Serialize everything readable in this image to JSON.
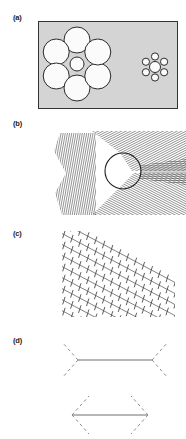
{
  "figure": {
    "background_color": "#ffffff",
    "width": 186,
    "height": 439,
    "panels": [
      {
        "id": "a",
        "label": "(a)",
        "illusion_name": "Ebbinghaus (Titchener circles) illusion",
        "description": "Two central circles of different size each surrounded by a ring of six inducer circles, on a gray rectangular field.",
        "label_x": 13,
        "label_y": 20,
        "field": {
          "x": 38,
          "y": 21,
          "width": 139,
          "height": 87,
          "fill": "#d4d4d4",
          "stroke": "#333333",
          "stroke_width": 1
        },
        "circle_fill": "#fbfbfb",
        "circle_stroke": "#2b2b2b",
        "circle_stroke_width": 1,
        "clusters": [
          {
            "name": "left-cluster",
            "center_x": 77,
            "center_y": 64,
            "center_radius": 7,
            "inducer_radius": 13,
            "inducer_ring_radius": 24,
            "inducer_count": 6,
            "inducer_start_angle": 90
          },
          {
            "name": "right-cluster",
            "center_x": 155,
            "center_y": 67,
            "center_radius": 5.5,
            "inducer_radius": 3.6,
            "inducer_ring_radius": 10.5,
            "inducer_count": 6,
            "inducer_start_angle": 90
          }
        ]
      },
      {
        "id": "b",
        "label": "(b)",
        "illusion_name": "Ehrenstein / Orbison circle distortion illusion",
        "description": "A circle superimposed on converging sets of fine oblique line gratings, making the circle appear deformed into a rounded triangle.",
        "label_x": 13,
        "label_y": 126,
        "line_color": "#3c3c3c",
        "line_width": 0.55,
        "line_spacing": 2.1,
        "circle": {
          "center_x": 123,
          "center_y": 171,
          "radius": 18,
          "stroke": "#1e1e1e",
          "stroke_width": 1.1
        },
        "grating_sectors": [
          {
            "name": "left-vertical-grating",
            "angle_deg": 80
          },
          {
            "name": "upper-right-grating",
            "angle_deg": 27
          },
          {
            "name": "lower-right-grating",
            "angle_deg": -27
          }
        ]
      },
      {
        "id": "c",
        "label": "(c)",
        "illusion_name": "Zollner illusion",
        "description": "Parallel oblique lines crossed by short transverse hatch marks, causing the long lines to appear non-parallel.",
        "label_x": 13,
        "label_y": 236,
        "line_color": "#4a4a4a",
        "main_line_angle_deg": -28,
        "hatch_angle_deg": 72,
        "main_line_count": 8,
        "hatch_length": 8,
        "hatch_spacing": 9,
        "main_line_width": 0.8,
        "hatch_line_width": 0.9,
        "region": {
          "x": 62,
          "y": 231,
          "width": 113,
          "height": 86
        }
      },
      {
        "id": "d",
        "label": "(d)",
        "illusion_name": "Muller-Lyer illusion",
        "description": "Two horizontal shafts of equal length; the upper has outward-pointing fins and the lower has inward-pointing fins, drawn with dashed strokes.",
        "label_x": 13,
        "label_y": 343,
        "shaft_color": "#6f6f6f",
        "fin_color": "#8a8a8a",
        "shaft_width": 1.2,
        "fin_width": 1.0,
        "fin_dash": "3 3",
        "figures": [
          {
            "name": "outward-fins-figure",
            "shaft_x1": 78,
            "shaft_x2": 152,
            "shaft_y": 360,
            "fin_dx": 16,
            "fin_dy": 18,
            "fin_direction": "outward"
          },
          {
            "name": "inward-fins-figure",
            "shaft_x1": 72,
            "shaft_x2": 148,
            "shaft_y": 415,
            "fin_dx": 17,
            "fin_dy": 19,
            "fin_direction": "inward"
          }
        ]
      }
    ]
  }
}
